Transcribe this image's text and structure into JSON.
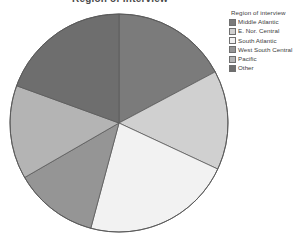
{
  "chart_data": {
    "type": "pie",
    "title": "Region of interview",
    "legend_title": "Region of interview",
    "legend_position": "right",
    "categories": [
      "Middle Atlantic",
      "E. Nor. Central",
      "South Atlantic",
      "West South Central",
      "Pacific",
      "Other"
    ],
    "values": [
      17.2,
      14.7,
      22.2,
      12.5,
      13.9,
      19.5
    ],
    "units": "percent",
    "start_angle_deg": 0,
    "direction": "clockwise",
    "slice_angles_deg": [
      62,
      53,
      80,
      45,
      50,
      70
    ],
    "colors": [
      "#7b7b7b",
      "#d0d0d0",
      "#f2f2f2",
      "#959595",
      "#b4b4b4",
      "#6e6e6e"
    ],
    "slices": [
      {
        "label": "Middle Atlantic",
        "value": 17.2,
        "angle_deg": 62,
        "color": "#7b7b7b"
      },
      {
        "label": "E. Nor. Central",
        "value": 14.7,
        "angle_deg": 53,
        "color": "#d0d0d0"
      },
      {
        "label": "South Atlantic",
        "value": 22.2,
        "angle_deg": 80,
        "color": "#f2f2f2"
      },
      {
        "label": "West South Central",
        "value": 12.5,
        "angle_deg": 45,
        "color": "#959595"
      },
      {
        "label": "Pacific",
        "value": 13.9,
        "angle_deg": 50,
        "color": "#b4b4b4"
      },
      {
        "label": "Other",
        "value": 19.5,
        "angle_deg": 70,
        "color": "#6e6e6e"
      }
    ],
    "xlabel": "",
    "ylabel": "",
    "grid": false,
    "outline_color": "#5a5a5a"
  },
  "legend": {
    "title": "Region of interview",
    "items": [
      {
        "label": "Middle Atlantic",
        "color": "#7b7b7b"
      },
      {
        "label": "E. Nor. Central",
        "color": "#d0d0d0"
      },
      {
        "label": "South Atlantic",
        "color": "#f2f2f2"
      },
      {
        "label": "West South Central",
        "color": "#959595"
      },
      {
        "label": "Pacific",
        "color": "#b4b4b4"
      },
      {
        "label": "Other",
        "color": "#6e6e6e"
      }
    ]
  },
  "header": {
    "title": "Region of interview"
  }
}
